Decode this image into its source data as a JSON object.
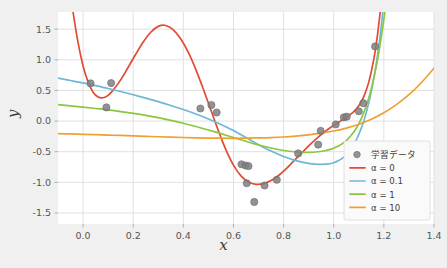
{
  "chart_data": {
    "type": "line",
    "title": "",
    "xlabel": "x",
    "ylabel": "y",
    "xlim": [
      -0.1,
      1.4
    ],
    "ylim": [
      -1.68,
      1.78
    ],
    "grid": true,
    "xticks": [
      "0.0",
      "0.2",
      "0.4",
      "0.6",
      "0.8",
      "1.0",
      "1.2",
      "1.4"
    ],
    "xtick_values": [
      0.0,
      0.2,
      0.4,
      0.6,
      0.8,
      1.0,
      1.2,
      1.4
    ],
    "yticks": [
      "1.5",
      "1.0",
      "0.5",
      "0.0",
      "-0.5",
      "-1.0",
      "-1.5"
    ],
    "ytick_values": [
      1.5,
      1.0,
      0.5,
      0.0,
      -0.5,
      -1.0,
      -1.5
    ],
    "legend_position": "lower right",
    "legend_entries": [
      {
        "label": "学習データ",
        "marker": "circle",
        "color": "#7f7f7f"
      },
      {
        "label": "α = 0",
        "marker": "line",
        "color": "#e24a33"
      },
      {
        "label": "α = 0.1",
        "marker": "line",
        "color": "#6cb8d6"
      },
      {
        "label": "α = 1",
        "marker": "line",
        "color": "#8cc63f"
      },
      {
        "label": "α = 10",
        "marker": "line",
        "color": "#f0a030"
      }
    ],
    "scatter": {
      "name": "学習データ",
      "color": "#7f7f7f",
      "points": [
        [
          0.03,
          0.615
        ],
        [
          0.093,
          0.223
        ],
        [
          0.112,
          0.62
        ],
        [
          0.468,
          0.205
        ],
        [
          0.512,
          0.262
        ],
        [
          0.533,
          0.14
        ],
        [
          0.632,
          -0.705
        ],
        [
          0.648,
          -0.725
        ],
        [
          0.653,
          -1.015
        ],
        [
          0.66,
          -0.735
        ],
        [
          0.683,
          -1.32
        ],
        [
          0.724,
          -1.052
        ],
        [
          0.773,
          -0.958
        ],
        [
          0.858,
          -0.528
        ],
        [
          0.938,
          -0.385
        ],
        [
          0.948,
          -0.16
        ],
        [
          1.008,
          -0.055
        ],
        [
          1.04,
          0.06
        ],
        [
          1.052,
          0.072
        ],
        [
          1.1,
          0.16
        ],
        [
          1.118,
          0.292
        ],
        [
          1.165,
          1.218
        ]
      ]
    },
    "series": [
      {
        "name": "α = 0",
        "color": "#e24a33",
        "points": [
          [
            -0.08,
            3.2
          ],
          [
            -0.06,
            2.4
          ],
          [
            -0.04,
            1.78
          ],
          [
            -0.02,
            1.28
          ],
          [
            0.0,
            0.9
          ],
          [
            0.02,
            0.64
          ],
          [
            0.04,
            0.47
          ],
          [
            0.06,
            0.392
          ],
          [
            0.08,
            0.38
          ],
          [
            0.1,
            0.42
          ],
          [
            0.12,
            0.505
          ],
          [
            0.15,
            0.672
          ],
          [
            0.18,
            0.878
          ],
          [
            0.21,
            1.09
          ],
          [
            0.24,
            1.29
          ],
          [
            0.27,
            1.45
          ],
          [
            0.3,
            1.545
          ],
          [
            0.33,
            1.56
          ],
          [
            0.36,
            1.49
          ],
          [
            0.39,
            1.34
          ],
          [
            0.42,
            1.12
          ],
          [
            0.45,
            0.84
          ],
          [
            0.48,
            0.52
          ],
          [
            0.51,
            0.18
          ],
          [
            0.54,
            -0.16
          ],
          [
            0.57,
            -0.47
          ],
          [
            0.6,
            -0.72
          ],
          [
            0.63,
            -0.895
          ],
          [
            0.66,
            -0.995
          ],
          [
            0.69,
            -1.032
          ],
          [
            0.72,
            -1.022
          ],
          [
            0.75,
            -0.972
          ],
          [
            0.78,
            -0.888
          ],
          [
            0.81,
            -0.78
          ],
          [
            0.84,
            -0.655
          ],
          [
            0.87,
            -0.53
          ],
          [
            0.9,
            -0.405
          ],
          [
            0.93,
            -0.29
          ],
          [
            0.96,
            -0.188
          ],
          [
            0.99,
            -0.098
          ],
          [
            1.02,
            -0.018
          ],
          [
            1.05,
            0.06
          ],
          [
            1.08,
            0.155
          ],
          [
            1.1,
            0.25
          ],
          [
            1.12,
            0.4
          ],
          [
            1.14,
            0.64
          ],
          [
            1.16,
            1.01
          ],
          [
            1.175,
            1.42
          ],
          [
            1.19,
            1.95
          ]
        ]
      },
      {
        "name": "α = 0.1",
        "color": "#6cb8d6",
        "points": [
          [
            -0.1,
            0.7
          ],
          [
            -0.05,
            0.662
          ],
          [
            0.0,
            0.622
          ],
          [
            0.05,
            0.578
          ],
          [
            0.1,
            0.532
          ],
          [
            0.15,
            0.482
          ],
          [
            0.2,
            0.43
          ],
          [
            0.25,
            0.375
          ],
          [
            0.3,
            0.318
          ],
          [
            0.35,
            0.255
          ],
          [
            0.4,
            0.188
          ],
          [
            0.45,
            0.115
          ],
          [
            0.5,
            0.035
          ],
          [
            0.55,
            -0.055
          ],
          [
            0.6,
            -0.155
          ],
          [
            0.65,
            -0.268
          ],
          [
            0.7,
            -0.385
          ],
          [
            0.75,
            -0.49
          ],
          [
            0.8,
            -0.578
          ],
          [
            0.85,
            -0.645
          ],
          [
            0.9,
            -0.69
          ],
          [
            0.93,
            -0.705
          ],
          [
            0.95,
            -0.708
          ],
          [
            0.98,
            -0.7
          ],
          [
            1.0,
            -0.68
          ],
          [
            1.02,
            -0.645
          ],
          [
            1.04,
            -0.59
          ],
          [
            1.06,
            -0.505
          ],
          [
            1.08,
            -0.385
          ],
          [
            1.1,
            -0.22
          ],
          [
            1.12,
            0.0
          ],
          [
            1.14,
            0.3
          ],
          [
            1.16,
            0.7
          ],
          [
            1.175,
            1.08
          ],
          [
            1.19,
            1.56
          ],
          [
            1.2,
            1.95
          ]
        ]
      },
      {
        "name": "α = 1",
        "color": "#8cc63f",
        "points": [
          [
            -0.1,
            0.268
          ],
          [
            -0.05,
            0.248
          ],
          [
            0.0,
            0.228
          ],
          [
            0.05,
            0.205
          ],
          [
            0.1,
            0.182
          ],
          [
            0.15,
            0.155
          ],
          [
            0.2,
            0.125
          ],
          [
            0.25,
            0.092
          ],
          [
            0.3,
            0.055
          ],
          [
            0.35,
            0.012
          ],
          [
            0.4,
            -0.035
          ],
          [
            0.45,
            -0.088
          ],
          [
            0.5,
            -0.145
          ],
          [
            0.55,
            -0.205
          ],
          [
            0.6,
            -0.268
          ],
          [
            0.65,
            -0.33
          ],
          [
            0.7,
            -0.39
          ],
          [
            0.75,
            -0.44
          ],
          [
            0.8,
            -0.48
          ],
          [
            0.85,
            -0.505
          ],
          [
            0.88,
            -0.512
          ],
          [
            0.9,
            -0.512
          ],
          [
            0.93,
            -0.505
          ],
          [
            0.96,
            -0.488
          ],
          [
            0.99,
            -0.458
          ],
          [
            1.01,
            -0.425
          ],
          [
            1.03,
            -0.38
          ],
          [
            1.05,
            -0.318
          ],
          [
            1.07,
            -0.232
          ],
          [
            1.09,
            -0.118
          ],
          [
            1.11,
            0.04
          ],
          [
            1.13,
            0.25
          ],
          [
            1.15,
            0.53
          ],
          [
            1.17,
            0.9
          ],
          [
            1.19,
            1.38
          ],
          [
            1.21,
            1.96
          ]
        ]
      },
      {
        "name": "α = 10",
        "color": "#f0a030",
        "points": [
          [
            -0.1,
            -0.205
          ],
          [
            -0.05,
            -0.21
          ],
          [
            0.0,
            -0.216
          ],
          [
            0.05,
            -0.222
          ],
          [
            0.1,
            -0.228
          ],
          [
            0.15,
            -0.235
          ],
          [
            0.2,
            -0.242
          ],
          [
            0.25,
            -0.249
          ],
          [
            0.3,
            -0.256
          ],
          [
            0.35,
            -0.262
          ],
          [
            0.4,
            -0.268
          ],
          [
            0.45,
            -0.273
          ],
          [
            0.5,
            -0.277
          ],
          [
            0.55,
            -0.28
          ],
          [
            0.6,
            -0.281
          ],
          [
            0.65,
            -0.28
          ],
          [
            0.7,
            -0.276
          ],
          [
            0.75,
            -0.27
          ],
          [
            0.8,
            -0.26
          ],
          [
            0.85,
            -0.245
          ],
          [
            0.9,
            -0.225
          ],
          [
            0.95,
            -0.198
          ],
          [
            1.0,
            -0.162
          ],
          [
            1.05,
            -0.115
          ],
          [
            1.1,
            -0.052
          ],
          [
            1.15,
            0.03
          ],
          [
            1.2,
            0.135
          ],
          [
            1.25,
            0.268
          ],
          [
            1.3,
            0.43
          ],
          [
            1.35,
            0.63
          ],
          [
            1.4,
            0.862
          ],
          [
            1.42,
            0.968
          ]
        ]
      }
    ]
  },
  "style": {
    "figure_background": "#f0f0f0",
    "axes_background": "#ffffff",
    "grid_color": "#e0e0e0",
    "tick_label_color": "#555555",
    "axis_label_color": "#3a3a3a",
    "legend_background": "#fafafa",
    "legend_border": "#d8d8d8"
  }
}
